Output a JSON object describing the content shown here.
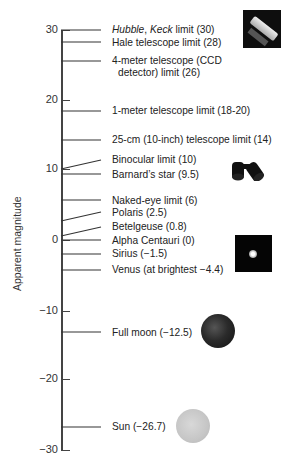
{
  "diagram": {
    "y_axis_label": "Apparent magnitude",
    "ticks": [
      {
        "value": 30,
        "label": "30",
        "y": 30
      },
      {
        "value": 20,
        "label": "20",
        "y": 100
      },
      {
        "value": 10,
        "label": "10",
        "y": 169
      },
      {
        "value": 0,
        "label": "0",
        "y": 240
      },
      {
        "value": -10,
        "label": "−10",
        "y": 311
      },
      {
        "value": -20,
        "label": "−20",
        "y": 379
      },
      {
        "value": -30,
        "label": "−30",
        "y": 450
      }
    ],
    "markers": [
      {
        "italic_a": "Hubble",
        "sep": ", ",
        "italic_b": "Keck",
        "rest": " limit (30)",
        "label": "Hubble, Keck limit (30)",
        "magnitude": 30
      },
      {
        "label": "Hale telescope limit (28)",
        "magnitude": 28
      },
      {
        "label_line1": "4-meter telescope (CCD",
        "label_line2": "detector) limit (26)",
        "magnitude": 26
      },
      {
        "label": "1-meter telescope limit (18-20)",
        "magnitude": "18-20"
      },
      {
        "label": "25-cm (10-inch) telescope limit (14)",
        "magnitude": 14
      },
      {
        "label": "Binocular limit (10)",
        "magnitude": 10
      },
      {
        "label": "Barnard’s star (9.5)",
        "magnitude": 9.5
      },
      {
        "label": "Naked-eye limit (6)",
        "magnitude": 6
      },
      {
        "label": "Polaris (2.5)",
        "magnitude": 2.5
      },
      {
        "label": "Betelgeuse (0.8)",
        "magnitude": 0.8
      },
      {
        "label": "Alpha Centauri (0)",
        "magnitude": 0
      },
      {
        "label": "Sirius (−1.5)",
        "magnitude": -1.5
      },
      {
        "label": "Venus (at brightest −4.4)",
        "magnitude": -4.4
      },
      {
        "label": "Full moon (−12.5)",
        "magnitude": -12.5
      },
      {
        "label": "Sun (−26.7)",
        "magnitude": -26.7
      }
    ],
    "images": [
      "hubble-telescope-image",
      "binoculars-image",
      "sirius-star-image",
      "full-moon-image",
      "sun-image"
    ]
  }
}
